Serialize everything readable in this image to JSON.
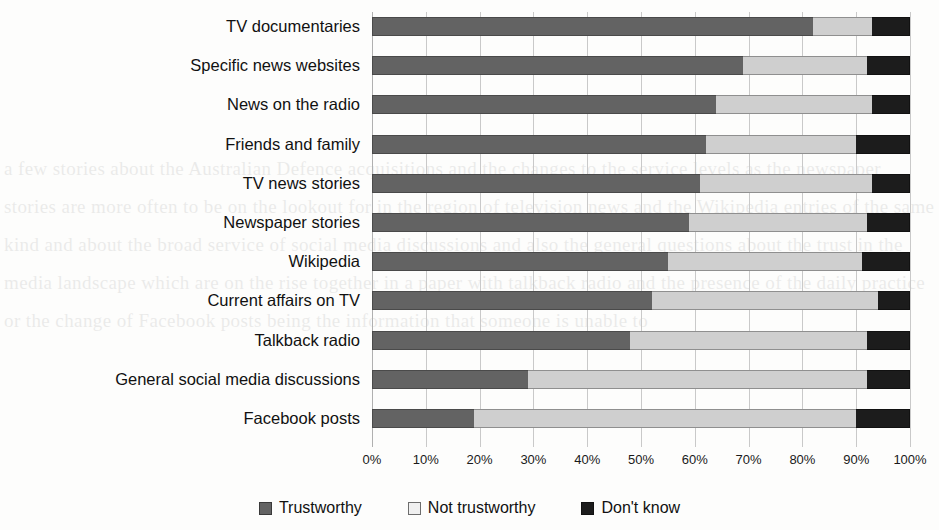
{
  "chart_data": {
    "type": "bar",
    "orientation": "horizontal",
    "stacked": true,
    "stack_total": 100,
    "title": "",
    "xlabel": "",
    "ylabel": "",
    "xlim": [
      0,
      100
    ],
    "grid": true,
    "legend_position": "bottom",
    "categories": [
      "TV documentaries",
      "Specific news websites",
      "News on the radio",
      "Friends and family",
      "TV news stories",
      "Newspaper stories",
      "Wikipedia",
      "Current affairs on TV",
      "Talkback radio",
      "General social media discussions",
      "Facebook posts"
    ],
    "xticks": [
      "0%",
      "10%",
      "20%",
      "30%",
      "40%",
      "50%",
      "60%",
      "70%",
      "80%",
      "90%",
      "100%"
    ],
    "xtick_values": [
      0,
      10,
      20,
      30,
      40,
      50,
      60,
      70,
      80,
      90,
      100
    ],
    "series": [
      {
        "name": "Trustworthy",
        "color": "#636363",
        "values": [
          82,
          69,
          64,
          62,
          61,
          59,
          55,
          52,
          48,
          29,
          19
        ]
      },
      {
        "name": "Not trustworthy",
        "color": "#cfcfcf",
        "values": [
          11,
          23,
          29,
          28,
          32,
          33,
          36,
          42,
          44,
          63,
          71
        ]
      },
      {
        "name": "Don't know",
        "color": "#1c1c1c",
        "values": [
          7,
          8,
          7,
          10,
          7,
          8,
          9,
          6,
          8,
          8,
          10
        ]
      }
    ]
  },
  "legend": {
    "items": [
      {
        "label": "Trustworthy",
        "swatch": "swatch-trust"
      },
      {
        "label": "Not trustworthy",
        "swatch": "swatch-nottrust"
      },
      {
        "label": "Don't know",
        "swatch": "swatch-dontknow"
      }
    ]
  },
  "background_text": "a few stories about the Australian Defence acquisitions and the changes to the service levels as the newspaper stories are more often to be on the lookout for in the region of television news and the Wikipedia entries of the same kind and about the broad service of social media discussions and also the general questions about the trust in the media landscape which are on the rise together in a paper with talkback radio and the presence of the daily practice or the change of Facebook posts being the information that someone is unable to"
}
